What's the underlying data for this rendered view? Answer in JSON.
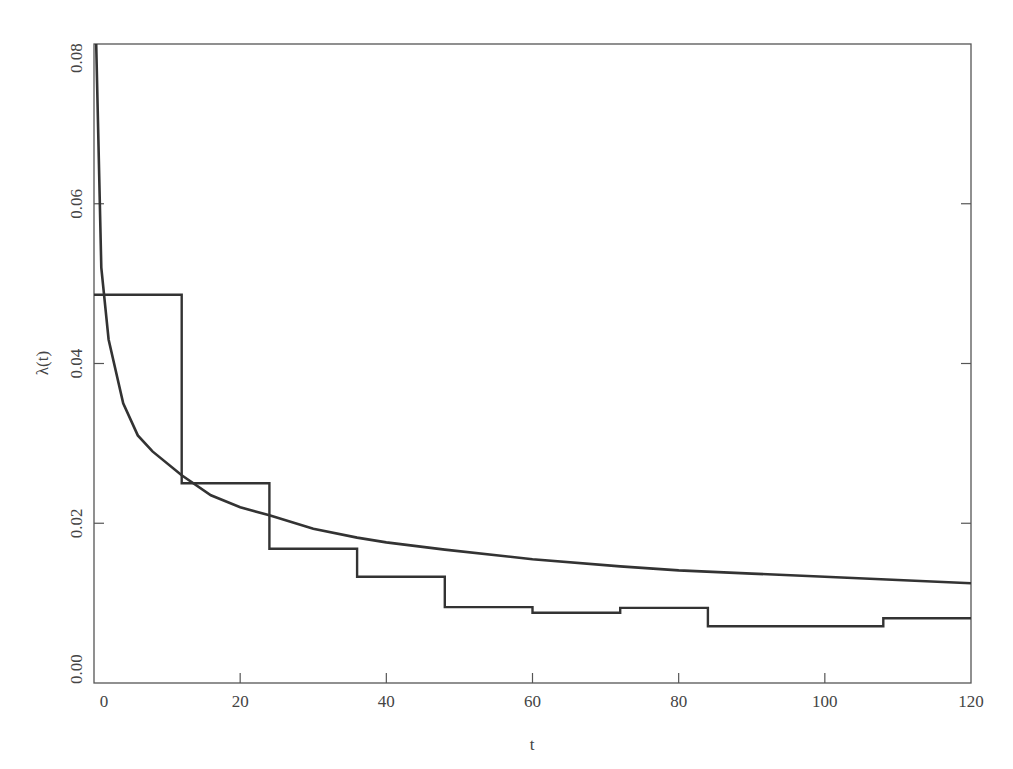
{
  "chart_data": {
    "type": "line",
    "title": "",
    "xlabel": "t",
    "ylabel": "λ(t)",
    "xlim": [
      0,
      120
    ],
    "ylim": [
      0.0,
      0.08
    ],
    "grid": false,
    "legend": null,
    "x_ticks": [
      0,
      20,
      40,
      60,
      80,
      100,
      120
    ],
    "x_tick_labels": [
      "0",
      "20",
      "40",
      "60",
      "80",
      "100",
      "120"
    ],
    "y_ticks": [
      0.0,
      0.02,
      0.04,
      0.06,
      0.08
    ],
    "y_tick_labels": [
      "0.00",
      "0.02",
      "0.04",
      "0.06",
      "0.08"
    ],
    "series": [
      {
        "name": "smooth hazard",
        "style": "curve",
        "x": [
          0.3,
          1,
          2,
          4,
          6,
          8,
          12,
          16,
          20,
          24,
          30,
          36,
          40,
          48,
          60,
          72,
          80,
          90,
          100,
          110,
          120
        ],
        "values": [
          0.08,
          0.052,
          0.043,
          0.035,
          0.031,
          0.029,
          0.026,
          0.0235,
          0.022,
          0.021,
          0.0193,
          0.0182,
          0.0176,
          0.0167,
          0.0155,
          0.0146,
          0.0141,
          0.0137,
          0.0133,
          0.0129,
          0.0125
        ]
      },
      {
        "name": "piecewise-constant hazard",
        "style": "step",
        "breaks": [
          0,
          12,
          24,
          36,
          48,
          60,
          72,
          84,
          108,
          120
        ],
        "values": [
          0.0486,
          0.025,
          0.0168,
          0.0133,
          0.0095,
          0.0088,
          0.0094,
          0.0071,
          0.0081
        ]
      }
    ]
  }
}
